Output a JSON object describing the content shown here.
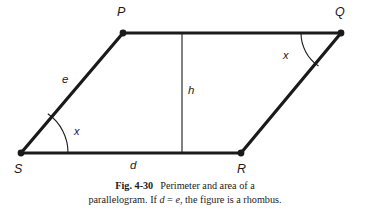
{
  "figure": {
    "id": "fig-4-30",
    "vertices": [
      {
        "name": "P",
        "label": "P",
        "x": 123,
        "y": 33,
        "label_x": 117,
        "label_y": 6
      },
      {
        "name": "Q",
        "label": "Q",
        "x": 341,
        "y": 33,
        "label_x": 335,
        "label_y": 6
      },
      {
        "name": "R",
        "label": "R",
        "x": 241,
        "y": 153,
        "label_x": 237,
        "label_y": 163
      },
      {
        "name": "S",
        "label": "S",
        "x": 21,
        "y": 153,
        "label_x": 14,
        "label_y": 163
      }
    ],
    "sides": [
      {
        "name": "side-sp",
        "label": "e",
        "from": "S",
        "to": "P",
        "label_x": 62,
        "label_y": 74
      },
      {
        "name": "side-sr",
        "label": "d",
        "from": "S",
        "to": "R",
        "label_x": 130,
        "label_y": 160
      }
    ],
    "height": {
      "name": "height-line",
      "label": "h",
      "x": 182,
      "y_top": 33,
      "y_bottom": 153,
      "label_x": 188,
      "label_y": 85
    },
    "angles": [
      {
        "name": "angle-at-s",
        "label": "x",
        "vertex": "S",
        "radius": 47,
        "label_x": 74,
        "label_y": 126
      },
      {
        "name": "angle-at-q",
        "label": "x",
        "vertex": "Q",
        "radius": 40,
        "label_x": 283,
        "label_y": 50
      }
    ],
    "colors": {
      "stroke": "#1a1a1a",
      "background": "#ffffff",
      "text": "#1b1b1b"
    }
  },
  "caption": {
    "figure_number": "Fig. 4-30",
    "line1_text": "Perimeter and area of a",
    "line2_prefix": "parallelogram. If ",
    "line2_var1": "d",
    "line2_equals": " = ",
    "line2_var2": "e",
    "line2_suffix": ", the figure is a rhombus."
  }
}
